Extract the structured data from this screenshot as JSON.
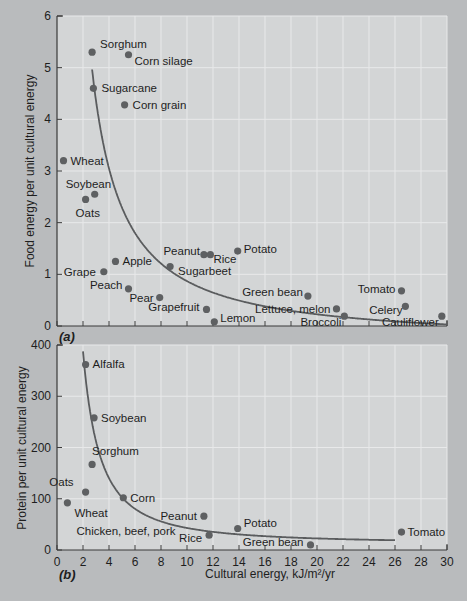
{
  "colors": {
    "background": "#b9bbbd",
    "plot_bg": "#d3d5d6",
    "grid": "#e8e9ea",
    "axis": "#3a3a3a",
    "curve": "#5a5c5e",
    "point": "#5e6062",
    "text": "#1e1e1e"
  },
  "chart_data": [
    {
      "type": "scatter",
      "panel_label": "(a)",
      "title": "",
      "xlabel": "",
      "ylabel": "Food energy per unit cultural energy",
      "xlim": [
        0,
        30
      ],
      "ylim": [
        0,
        6
      ],
      "xticks": [
        0,
        2,
        4,
        6,
        8,
        10,
        12,
        14,
        16,
        18,
        20,
        22,
        24,
        26,
        28,
        30
      ],
      "yticks": [
        0,
        1,
        2,
        3,
        4,
        5,
        6
      ],
      "show_x_tick_labels": false,
      "grid": true,
      "points": [
        {
          "label": "Sorghum",
          "x": 2.7,
          "y": 5.3,
          "lx": 8,
          "ly": -8,
          "anchor": "start"
        },
        {
          "label": "Corn silage",
          "x": 5.5,
          "y": 5.25,
          "lx": 6,
          "ly": 6,
          "anchor": "start"
        },
        {
          "label": "Sugarcane",
          "x": 2.8,
          "y": 4.6,
          "lx": 8,
          "ly": 0,
          "anchor": "start"
        },
        {
          "label": "Corn grain",
          "x": 5.2,
          "y": 4.28,
          "lx": 8,
          "ly": 0,
          "anchor": "start"
        },
        {
          "label": "Wheat",
          "x": 0.5,
          "y": 3.2,
          "lx": 7,
          "ly": 0,
          "anchor": "start"
        },
        {
          "label": "Soybean",
          "x": 2.9,
          "y": 2.55,
          "lx": -29,
          "ly": -10,
          "anchor": "start"
        },
        {
          "label": "Oats",
          "x": 2.2,
          "y": 2.45,
          "lx": -10,
          "ly": 14,
          "anchor": "start"
        },
        {
          "label": "Apple",
          "x": 4.5,
          "y": 1.25,
          "lx": 7,
          "ly": 0,
          "anchor": "start"
        },
        {
          "label": "Grape",
          "x": 3.6,
          "y": 1.05,
          "lx": -8,
          "ly": 0,
          "anchor": "end"
        },
        {
          "label": "Peach",
          "x": 5.5,
          "y": 0.72,
          "lx": -6,
          "ly": -4,
          "anchor": "end"
        },
        {
          "label": "Pear",
          "x": 7.9,
          "y": 0.55,
          "lx": -6,
          "ly": 0,
          "anchor": "end"
        },
        {
          "label": "Sugarbeet",
          "x": 8.7,
          "y": 1.15,
          "lx": 8,
          "ly": 4,
          "anchor": "start"
        },
        {
          "label": "Peanut",
          "x": 11.3,
          "y": 1.38,
          "lx": -4,
          "ly": -4,
          "anchor": "end"
        },
        {
          "label": "Rice",
          "x": 11.8,
          "y": 1.38,
          "lx": 3,
          "ly": 4,
          "anchor": "start"
        },
        {
          "label": "Potato",
          "x": 13.9,
          "y": 1.45,
          "lx": 6,
          "ly": -2,
          "anchor": "start"
        },
        {
          "label": "Grapefruit",
          "x": 11.5,
          "y": 0.32,
          "lx": -7,
          "ly": -2,
          "anchor": "end"
        },
        {
          "label": "Lemon",
          "x": 12.1,
          "y": 0.08,
          "lx": 6,
          "ly": -4,
          "anchor": "start"
        },
        {
          "label": "Green bean",
          "x": 19.3,
          "y": 0.58,
          "lx": -5,
          "ly": -4,
          "anchor": "end"
        },
        {
          "label": "Tomato",
          "x": 26.5,
          "y": 0.68,
          "lx": -6,
          "ly": -2,
          "anchor": "end"
        },
        {
          "label": "Lettuce, melon",
          "x": 21.5,
          "y": 0.33,
          "lx": -6,
          "ly": 0,
          "anchor": "end"
        },
        {
          "label": "Broccoli",
          "x": 22.1,
          "y": 0.19,
          "lx": -3,
          "ly": 6,
          "anchor": "end"
        },
        {
          "label": "Celery",
          "x": 26.8,
          "y": 0.38,
          "lx": -3,
          "ly": 4,
          "anchor": "end"
        },
        {
          "label": "Cauliflower",
          "x": 29.6,
          "y": 0.19,
          "lx": -3,
          "ly": 6,
          "anchor": "end"
        }
      ],
      "curve": {
        "type": "hyperbola",
        "k": 13.0,
        "c": 0.35,
        "x_start": 2.7,
        "x_end": 30
      }
    },
    {
      "type": "scatter",
      "panel_label": "(b)",
      "title": "",
      "xlabel": "Cultural energy, kJ/m²/yr",
      "ylabel": "Protein per unit cultural energy",
      "xlim": [
        0,
        30
      ],
      "ylim": [
        0,
        400
      ],
      "xticks": [
        0,
        2,
        4,
        6,
        8,
        10,
        12,
        14,
        16,
        18,
        20,
        22,
        24,
        26,
        28,
        30
      ],
      "yticks": [
        0,
        100,
        200,
        300,
        400
      ],
      "show_x_tick_labels": true,
      "grid": true,
      "points": [
        {
          "label": "Alfalfa",
          "x": 2.2,
          "y": 362,
          "lx": 7,
          "ly": 0,
          "anchor": "start"
        },
        {
          "label": "Soybean",
          "x": 2.85,
          "y": 258,
          "lx": 7,
          "ly": 0,
          "anchor": "start"
        },
        {
          "label": "Sorghum",
          "x": 2.7,
          "y": 167,
          "lx": 0,
          "ly": -13,
          "anchor": "start"
        },
        {
          "label": "Oats",
          "x": 2.2,
          "y": 113,
          "lx": -12,
          "ly": -10,
          "anchor": "end"
        },
        {
          "label": "Wheat",
          "x": 0.8,
          "y": 92,
          "lx": 7,
          "ly": 10,
          "anchor": "start"
        },
        {
          "label": "Corn",
          "x": 5.1,
          "y": 102,
          "lx": 7,
          "ly": 0,
          "anchor": "start"
        },
        {
          "label": "Peanut",
          "x": 11.3,
          "y": 66,
          "lx": -7,
          "ly": 0,
          "anchor": "end"
        },
        {
          "label": "Rice",
          "x": 11.7,
          "y": 29,
          "lx": -7,
          "ly": 3,
          "anchor": "end"
        },
        {
          "label": "Potato",
          "x": 13.9,
          "y": 42,
          "lx": 6,
          "ly": -5,
          "anchor": "start"
        },
        {
          "label": "Green bean",
          "x": 19.5,
          "y": 10,
          "lx": -7,
          "ly": -3,
          "anchor": "end"
        },
        {
          "label": "Tomato",
          "x": 26.5,
          "y": 35,
          "lx": 6,
          "ly": 0,
          "anchor": "start"
        },
        {
          "label": "Chicken, beef, pork",
          "x": null,
          "y": null,
          "text_x": 1.5,
          "text_y": 37,
          "anchor": "start"
        }
      ],
      "curve": {
        "type": "hyperbola",
        "k": 1000,
        "c": 0,
        "x_start": 2.0,
        "x_end": 26
      }
    }
  ],
  "axes_labels": {
    "a_ylabel": "Food energy per unit cultural energy",
    "b_ylabel": "Protein per unit cultural energy",
    "xlabel": "Cultural energy, kJ/m²/yr",
    "panel_a": "(a)",
    "panel_b": "(b)"
  }
}
